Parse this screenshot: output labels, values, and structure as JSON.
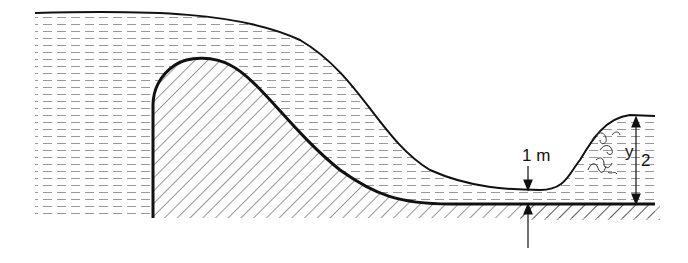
{
  "diagram": {
    "labels": {
      "depth_1": "1 m",
      "depth_2_symbol": "y",
      "depth_2_subscript": "2"
    },
    "colors": {
      "line": "#111111",
      "water_dash": "#888888",
      "hatch": "#333333",
      "background": "#ffffff"
    }
  }
}
